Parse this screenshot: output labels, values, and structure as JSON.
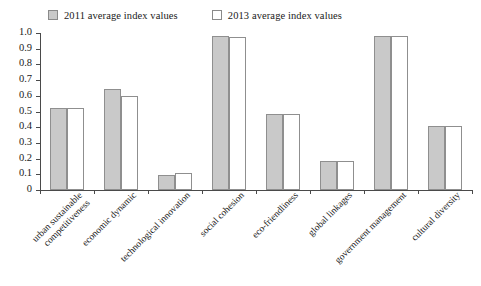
{
  "legend": {
    "entries": [
      {
        "label": "2011 average index values",
        "swatch": "filled",
        "color": "#c9c9c9"
      },
      {
        "label": "2013 average index values",
        "swatch": "hollow",
        "color": "#ffffff"
      }
    ]
  },
  "axis": {
    "y_ticks": [
      "1.0",
      "0.9",
      "0.8",
      "0.7",
      "0.6",
      "0.5",
      "0.4",
      "0.3",
      "0.2",
      "0.1",
      "0"
    ]
  },
  "chart_data": {
    "type": "bar",
    "title": "",
    "xlabel": "",
    "ylabel": "",
    "ylim": [
      0,
      1.0
    ],
    "ytick_values": [
      0,
      0.1,
      0.2,
      0.3,
      0.4,
      0.5,
      0.6,
      0.7,
      0.8,
      0.9,
      1.0
    ],
    "grid": false,
    "legend_position": "top",
    "categories": [
      "urban sustainable competitiveness",
      "economic dynamic",
      "technological innovation",
      "social cohesion",
      "eco-friendliness",
      "global linkages",
      "government management",
      "cultural diversity"
    ],
    "category_lines": [
      [
        "urban sustainable",
        "competitiveness"
      ],
      [
        "economic dynamic"
      ],
      [
        "technological innovation"
      ],
      [
        "social cohesion"
      ],
      [
        "eco-friendliness"
      ],
      [
        "global linkages"
      ],
      [
        "government management"
      ],
      [
        "cultural diversity"
      ]
    ],
    "series": [
      {
        "name": "2011 average index values",
        "color": "#c9c9c9",
        "values": [
          0.52,
          0.645,
          0.095,
          0.98,
          0.487,
          0.185,
          0.98,
          0.41
        ]
      },
      {
        "name": "2013 average index values",
        "color": "#ffffff",
        "values": [
          0.52,
          0.6,
          0.11,
          0.975,
          0.487,
          0.185,
          0.98,
          0.41
        ]
      }
    ]
  }
}
